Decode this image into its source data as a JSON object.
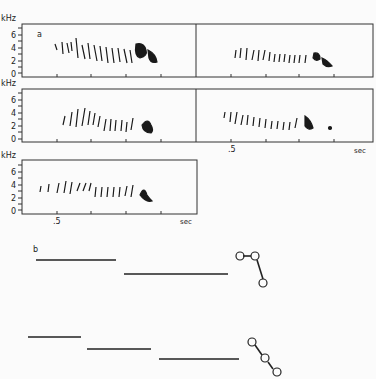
{
  "figure": {
    "panel_a_label": "a",
    "panel_b_label": "b",
    "y_axis_unit": "kHz",
    "y_ticks": [
      "0",
      "2",
      "4",
      "6"
    ],
    "x_tick_label": ".5",
    "x_axis_unit": "sec",
    "spectrograms": [
      {
        "id": "row1-left"
      },
      {
        "id": "row1-right"
      },
      {
        "id": "row2-left"
      },
      {
        "id": "row2-right"
      },
      {
        "id": "row3-left"
      }
    ],
    "diagram_b": {
      "top": {
        "segments": 2,
        "nodes": 3
      },
      "bottom": {
        "segments": 3,
        "nodes": 3
      }
    },
    "colors": {
      "ink": "#222222",
      "background": "#fbfbfb"
    }
  }
}
